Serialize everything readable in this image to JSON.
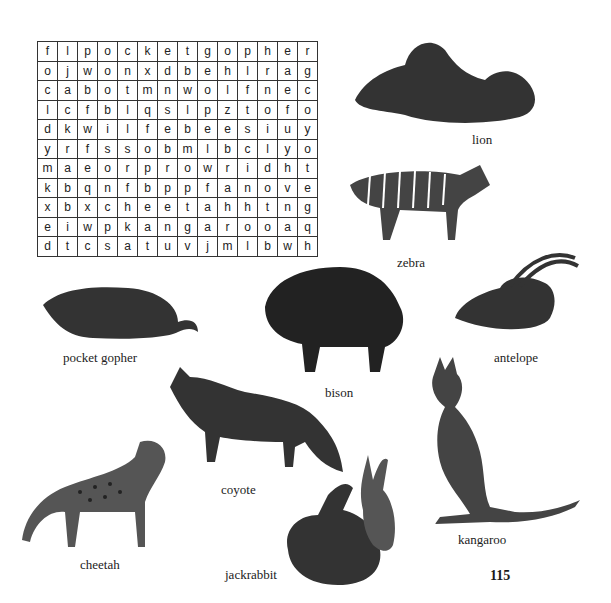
{
  "puzzle": {
    "grid": [
      [
        "f",
        "l",
        "p",
        "o",
        "c",
        "k",
        "e",
        "t",
        "g",
        "o",
        "p",
        "h",
        "e",
        "r"
      ],
      [
        "o",
        "j",
        "w",
        "o",
        "n",
        "x",
        "d",
        "b",
        "e",
        "h",
        "l",
        "r",
        "a",
        "g"
      ],
      [
        "c",
        "a",
        "b",
        "o",
        "t",
        "m",
        "n",
        "w",
        "o",
        "l",
        "f",
        "n",
        "e",
        "c"
      ],
      [
        "l",
        "c",
        "f",
        "b",
        "l",
        "q",
        "s",
        "l",
        "p",
        "z",
        "t",
        "o",
        "f",
        "o"
      ],
      [
        "d",
        "k",
        "w",
        "i",
        "l",
        "f",
        "e",
        "b",
        "e",
        "e",
        "s",
        "i",
        "u",
        "y"
      ],
      [
        "y",
        "r",
        "f",
        "s",
        "s",
        "o",
        "b",
        "m",
        "l",
        "b",
        "c",
        "l",
        "y",
        "o"
      ],
      [
        "m",
        "a",
        "e",
        "o",
        "r",
        "p",
        "r",
        "o",
        "w",
        "r",
        "i",
        "d",
        "h",
        "t"
      ],
      [
        "k",
        "b",
        "q",
        "n",
        "f",
        "b",
        "p",
        "p",
        "f",
        "a",
        "n",
        "o",
        "v",
        "e"
      ],
      [
        "x",
        "b",
        "x",
        "c",
        "h",
        "e",
        "e",
        "t",
        "a",
        "h",
        "h",
        "t",
        "n",
        "g"
      ],
      [
        "e",
        "i",
        "w",
        "p",
        "k",
        "a",
        "n",
        "g",
        "a",
        "r",
        "o",
        "o",
        "a",
        "q"
      ],
      [
        "d",
        "t",
        "c",
        "s",
        "a",
        "t",
        "u",
        "v",
        "j",
        "m",
        "l",
        "b",
        "w",
        "h"
      ]
    ]
  },
  "labels": {
    "lion": "lion",
    "zebra": "zebra",
    "pocket_gopher": "pocket gopher",
    "antelope": "antelope",
    "bison": "bison",
    "coyote": "coyote",
    "cheetah": "cheetah",
    "jackrabbit": "jackrabbit",
    "kangaroo": "kangaroo"
  },
  "page_number": "115"
}
